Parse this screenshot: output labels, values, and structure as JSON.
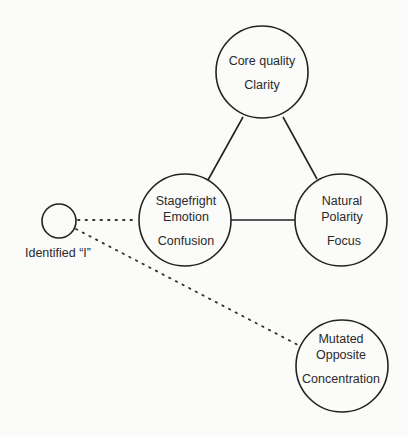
{
  "diagram": {
    "colors": {
      "stroke": "#222222",
      "text": "#2a2a2a",
      "background": "#fbfbf9"
    },
    "nodes": {
      "core": {
        "line1": "Core quality",
        "line2": "Clarity"
      },
      "stagefright": {
        "line1": "Stagefright",
        "line2": "Emotion",
        "line3": "Confusion"
      },
      "polarity": {
        "line1": "Natural",
        "line2": "Polarity",
        "line3": "Focus"
      },
      "mutated": {
        "line1": "Mutated",
        "line2": "Opposite",
        "line3": "Concentration"
      },
      "identified": {
        "label": "Identified “I”"
      }
    },
    "edges": [
      {
        "from": "core",
        "to": "stagefright",
        "style": "solid"
      },
      {
        "from": "core",
        "to": "polarity",
        "style": "solid"
      },
      {
        "from": "stagefright",
        "to": "polarity",
        "style": "solid"
      },
      {
        "from": "identified",
        "to": "stagefright",
        "style": "dotted"
      },
      {
        "from": "identified",
        "to": "mutated",
        "style": "dotted"
      }
    ]
  }
}
